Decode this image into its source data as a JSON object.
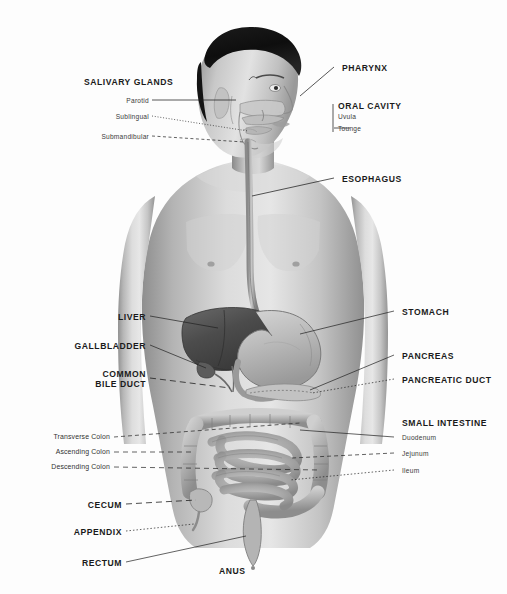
{
  "diagram": {
    "background_color": "#fdfdfd",
    "ink_color": "#1a1a1a",
    "figure": "grayscale anatomical illustration of a male human torso and head in three-quarter view with internal digestive organs exposed"
  },
  "labels": {
    "left": {
      "salivary_glands": "SALIVARY GLANDS",
      "parotid": "Parotid",
      "sublingual": "Sublingual",
      "submandibular": "Submandibular",
      "liver": "LIVER",
      "gallbladder": "GALLBLADDER",
      "common_bile_duct_line1": "COMMON",
      "common_bile_duct_line2": "BILE DUCT",
      "transverse_colon": "Transverse Colon",
      "ascending_colon": "Ascending Colon",
      "descending_colon": "Descending Colon",
      "cecum": "CECUM",
      "appendix": "APPENDIX",
      "rectum": "RECTUM"
    },
    "right": {
      "pharynx": "PHARYNX",
      "oral_cavity": "ORAL CAVITY",
      "uvula": "Uvula",
      "tounge": "Tounge",
      "esophagus": "ESOPHAGUS",
      "stomach": "STOMACH",
      "pancreas": "PANCREAS",
      "pancreatic_duct": "PANCREATIC DUCT",
      "small_intestine": "SMALL INTESTINE",
      "duodenum": "Duodenum",
      "jejunum": "Jejunum",
      "ileum": "Ileum"
    },
    "bottom": {
      "anus": "ANUS"
    }
  }
}
